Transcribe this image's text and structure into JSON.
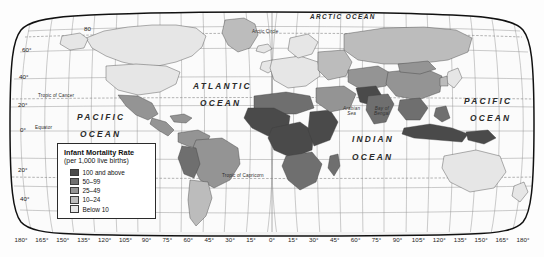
{
  "map": {
    "projection": "robinson",
    "title_present": false,
    "legend": {
      "title": "Infant Mortality Rate",
      "subtitle": "(per 1,000 live births)",
      "classes": [
        {
          "label": "100 and above",
          "color": "#4a4a4a"
        },
        {
          "label": "50–99",
          "color": "#6f6f6f"
        },
        {
          "label": "25–49",
          "color": "#949494"
        },
        {
          "label": "10–24",
          "color": "#bcbcbc"
        },
        {
          "label": "Below 10",
          "color": "#e6e6e6"
        }
      ]
    },
    "longitude_labels": [
      "180°",
      "165°",
      "150°",
      "135°",
      "120°",
      "105°",
      "90°",
      "75°",
      "60°",
      "45°",
      "30°",
      "15°",
      "0°",
      "15°",
      "30°",
      "45°",
      "60°",
      "75°",
      "90°",
      "105°",
      "120°",
      "135°",
      "150°",
      "165°",
      "180°"
    ],
    "latitude_labels": [
      {
        "text": "80",
        "x": 84,
        "y": 31
      },
      {
        "text": "60°",
        "x": 22,
        "y": 52
      },
      {
        "text": "40°",
        "x": 19,
        "y": 79
      },
      {
        "text": "20°",
        "x": 18,
        "y": 107
      },
      {
        "text": "0°",
        "x": 20,
        "y": 140
      },
      {
        "text": "20°",
        "x": 18,
        "y": 172
      },
      {
        "text": "40°",
        "x": 20,
        "y": 201
      }
    ],
    "ocean_labels": [
      {
        "name": "arctic-ocean",
        "text": "ARCTIC OCEAN",
        "x": 310,
        "y": 18
      },
      {
        "name": "atlantic-ocean-line1",
        "text": "ATLANTIC",
        "x": 193,
        "y": 86
      },
      {
        "name": "atlantic-ocean-line2",
        "text": "OCEAN",
        "x": 200,
        "y": 103
      },
      {
        "name": "pacific-ocean-west-line1",
        "text": "PACIFIC",
        "x": 77,
        "y": 117
      },
      {
        "name": "pacific-ocean-west-line2",
        "text": "OCEAN",
        "x": 80,
        "y": 134
      },
      {
        "name": "pacific-ocean-east-line1",
        "text": "PACIFIC",
        "x": 464,
        "y": 101
      },
      {
        "name": "pacific-ocean-east-line2",
        "text": "OCEAN",
        "x": 470,
        "y": 118
      },
      {
        "name": "indian-ocean-line1",
        "text": "INDIAN",
        "x": 352,
        "y": 139
      },
      {
        "name": "indian-ocean-line2",
        "text": "OCEAN",
        "x": 352,
        "y": 157
      }
    ],
    "sea_labels": [
      {
        "name": "arabian-sea",
        "text": "Arabian\nSea",
        "x": 355,
        "y": 112
      },
      {
        "name": "bay-of-bengal",
        "text": "Bay of\nBengal",
        "x": 385,
        "y": 112
      }
    ],
    "reference_lines": [
      {
        "name": "arctic-circle",
        "text": "Arctic Circle",
        "x": 252,
        "y": 33
      },
      {
        "name": "tropic-of-cancer",
        "text": "Tropic of Cancer",
        "x": 38,
        "y": 97
      },
      {
        "name": "equator",
        "text": "Equator",
        "x": 35,
        "y": 128
      },
      {
        "name": "tropic-of-capricorn",
        "text": "Tropic of Capricorn",
        "x": 222,
        "y": 177
      }
    ]
  },
  "chart_data": {
    "type": "choropleth-map",
    "title": "Infant Mortality Rate",
    "subtitle": "(per 1,000 live births)",
    "unit": "deaths per 1,000 live births",
    "projection": "Robinson",
    "classes": [
      {
        "label": "100 and above",
        "min": 100,
        "max": null,
        "color": "#4a4a4a"
      },
      {
        "label": "50–99",
        "min": 50,
        "max": 99,
        "color": "#6f6f6f"
      },
      {
        "label": "25–49",
        "min": 25,
        "max": 49,
        "color": "#949494"
      },
      {
        "label": "10–24",
        "min": 10,
        "max": 24,
        "color": "#bcbcbc"
      },
      {
        "label": "Below 10",
        "min": 0,
        "max": 9,
        "color": "#e6e6e6"
      }
    ],
    "regions": [
      {
        "name": "Canada",
        "class": "Below 10"
      },
      {
        "name": "United States",
        "class": "Below 10"
      },
      {
        "name": "Greenland",
        "class": "10–24"
      },
      {
        "name": "Mexico",
        "class": "25–49"
      },
      {
        "name": "Central America",
        "class": "25–49"
      },
      {
        "name": "Brazil",
        "class": "25–49"
      },
      {
        "name": "Argentina",
        "class": "10–24"
      },
      {
        "name": "Chile",
        "class": "10–24"
      },
      {
        "name": "Peru",
        "class": "25–49"
      },
      {
        "name": "Bolivia",
        "class": "50–99"
      },
      {
        "name": "Western Europe",
        "class": "Below 10"
      },
      {
        "name": "Eastern Europe",
        "class": "10–24"
      },
      {
        "name": "Russia",
        "class": "10–24"
      },
      {
        "name": "North Africa",
        "class": "50–99"
      },
      {
        "name": "West Africa",
        "class": "100 and above"
      },
      {
        "name": "Central Africa",
        "class": "100 and above"
      },
      {
        "name": "East Africa",
        "class": "100 and above"
      },
      {
        "name": "Southern Africa",
        "class": "50–99"
      },
      {
        "name": "Middle East",
        "class": "25–49"
      },
      {
        "name": "India",
        "class": "50–99"
      },
      {
        "name": "Pakistan",
        "class": "100 and above"
      },
      {
        "name": "Afghanistan",
        "class": "100 and above"
      },
      {
        "name": "China",
        "class": "25–49"
      },
      {
        "name": "Southeast Asia",
        "class": "50–99"
      },
      {
        "name": "Japan",
        "class": "Below 10"
      },
      {
        "name": "Australia",
        "class": "Below 10"
      },
      {
        "name": "New Zealand",
        "class": "Below 10"
      }
    ],
    "legend_position": "lower-left-over-pacific",
    "graticule_interval_deg": 15,
    "grid": true
  }
}
